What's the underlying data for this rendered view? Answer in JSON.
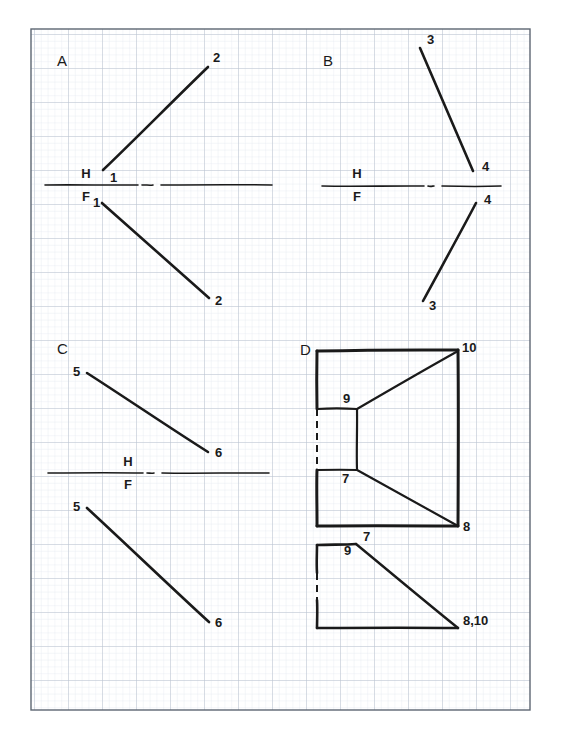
{
  "sheet": {
    "title": "Orthographic projection exercise sheet",
    "background_color": "#ffffff",
    "ink_color": "#1a1a1a",
    "grid": {
      "minor_color": "#dfe4ec",
      "major_color": "#b9c2cf",
      "border_color": "#6f7884",
      "minor_spacing": 6.8,
      "major_spacing": 34,
      "left": 31,
      "top": 29,
      "right": 530,
      "bottom": 710
    }
  },
  "chart_data": {
    "type": "diagram",
    "panels": [
      {
        "id": "A",
        "letter": "A",
        "letter_pos": [
          57,
          66
        ],
        "fold_line": {
          "label_top": "H",
          "label_bottom": "F",
          "label_x": 86,
          "label_top_y": 178,
          "label_bottom_y": 201,
          "y": 185,
          "x_start": 45,
          "x_end": 272,
          "gap_start": 138,
          "gap_end": 155
        },
        "lines": [
          {
            "name": "line-1-2-top",
            "x1": 103,
            "y1": 170,
            "x2": 208,
            "y2": 67,
            "width": 2.6
          },
          {
            "name": "line-1-2-bottom",
            "x1": 102,
            "y1": 203,
            "x2": 209,
            "y2": 298,
            "width": 2.6
          }
        ],
        "labels": [
          {
            "text": "1",
            "x": 110,
            "y": 182
          },
          {
            "text": "2",
            "x": 213,
            "y": 62
          },
          {
            "text": "1",
            "x": 93,
            "y": 207
          },
          {
            "text": "2",
            "x": 215,
            "y": 305
          }
        ]
      },
      {
        "id": "B",
        "letter": "B",
        "letter_pos": [
          323,
          66
        ],
        "fold_line": {
          "label_top": "H",
          "label_bottom": "F",
          "label_x": 357,
          "label_top_y": 178,
          "label_bottom_y": 201,
          "y": 186,
          "x_start": 322,
          "x_end": 501,
          "gap_start": 424,
          "gap_end": 436
        },
        "lines": [
          {
            "name": "line-3-4-top",
            "x1": 420,
            "y1": 48,
            "x2": 473,
            "y2": 171,
            "width": 2.6
          },
          {
            "name": "line-3-4-bottom",
            "x1": 423,
            "y1": 301,
            "x2": 476,
            "y2": 203,
            "width": 2.6
          }
        ],
        "labels": [
          {
            "text": "3",
            "x": 427,
            "y": 44
          },
          {
            "text": "4",
            "x": 482,
            "y": 171
          },
          {
            "text": "4",
            "x": 484,
            "y": 204
          },
          {
            "text": "3",
            "x": 429,
            "y": 310
          }
        ]
      },
      {
        "id": "C",
        "letter": "C",
        "letter_pos": [
          57,
          354
        ],
        "fold_line": {
          "label_top": "H",
          "label_bottom": "F",
          "label_x": 128,
          "label_top_y": 466,
          "label_bottom_y": 489,
          "y": 473,
          "x_start": 48,
          "x_end": 269,
          "gap_start": 143,
          "gap_end": 156
        },
        "lines": [
          {
            "name": "line-5-6-top",
            "x1": 87,
            "y1": 373,
            "x2": 208,
            "y2": 452,
            "width": 2.6
          },
          {
            "name": "line-5-6-bottom",
            "x1": 87,
            "y1": 508,
            "x2": 209,
            "y2": 622,
            "width": 2.6
          }
        ],
        "labels": [
          {
            "text": "5",
            "x": 73,
            "y": 376
          },
          {
            "text": "6",
            "x": 215,
            "y": 457
          },
          {
            "text": "5",
            "x": 73,
            "y": 511
          },
          {
            "text": "6",
            "x": 215,
            "y": 627
          }
        ]
      },
      {
        "id": "D",
        "letter": "D",
        "letter_pos": [
          300,
          355
        ],
        "fold_line": {
          "label_top": "",
          "label_bottom": "",
          "y": 0,
          "x_start": 0,
          "x_end": 0
        },
        "top_view": {
          "name": "d-top-view",
          "outline": [
            {
              "name": "d-top-edge",
              "x1": 317,
              "y1": 351,
              "x2": 458,
              "y2": 350,
              "width": 3.0
            },
            {
              "name": "d-left-upper-edge",
              "x1": 317,
              "y1": 351,
              "x2": 317,
              "y2": 409,
              "width": 3.0
            },
            {
              "name": "d-right-edge",
              "x1": 458,
              "y1": 350,
              "x2": 458,
              "y2": 526,
              "width": 3.0
            },
            {
              "name": "d-bottom-edge",
              "x1": 317,
              "y1": 526,
              "x2": 458,
              "y2": 526,
              "width": 3.0
            },
            {
              "name": "d-left-lower-edge",
              "x1": 317,
              "y1": 470,
              "x2": 317,
              "y2": 526,
              "width": 3.0
            },
            {
              "name": "d-notch-top",
              "x1": 317,
              "y1": 409,
              "x2": 357,
              "y2": 409,
              "width": 2.2
            },
            {
              "name": "d-notch-right",
              "x1": 357,
              "y1": 409,
              "x2": 357,
              "y2": 470,
              "width": 2.2
            },
            {
              "name": "d-notch-bottom",
              "x1": 317,
              "y1": 470,
              "x2": 357,
              "y2": 470,
              "width": 2.2
            },
            {
              "name": "d-diag-9-10",
              "x1": 357,
              "y1": 409,
              "x2": 458,
              "y2": 351,
              "width": 2.2
            },
            {
              "name": "d-diag-7-8",
              "x1": 357,
              "y1": 470,
              "x2": 458,
              "y2": 526,
              "width": 2.2
            }
          ],
          "hidden_left": {
            "name": "d-hidden-left-top",
            "x1": 317,
            "y1": 409,
            "x2": 317,
            "y2": 470,
            "width": 2.0
          },
          "labels": [
            {
              "text": "10",
              "x": 462,
              "y": 352
            },
            {
              "text": "9",
              "x": 343,
              "y": 403
            },
            {
              "text": "7",
              "x": 342,
              "y": 483
            },
            {
              "text": "8",
              "x": 463,
              "y": 531
            }
          ]
        },
        "front_view": {
          "name": "d-front-view",
          "outline": [
            {
              "name": "d-front-top-edge",
              "x1": 317,
              "y1": 545,
              "x2": 356,
              "y2": 544,
              "width": 2.6
            },
            {
              "name": "d-front-left-upper",
              "x1": 317,
              "y1": 545,
              "x2": 317,
              "y2": 573,
              "width": 2.6
            },
            {
              "name": "d-front-left-lower",
              "x1": 317,
              "y1": 600,
              "x2": 317,
              "y2": 628,
              "width": 2.6
            },
            {
              "name": "d-front-bottom-edge",
              "x1": 317,
              "y1": 628,
              "x2": 458,
              "y2": 628,
              "width": 2.6
            },
            {
              "name": "d-front-diag",
              "x1": 356,
              "y1": 544,
              "x2": 458,
              "y2": 628,
              "width": 2.4
            }
          ],
          "hidden_left": {
            "name": "d-hidden-left-front",
            "x1": 317,
            "y1": 573,
            "x2": 317,
            "y2": 600,
            "width": 2.0
          },
          "labels": [
            {
              "text": "7",
              "x": 363,
              "y": 541
            },
            {
              "text": "9",
              "x": 344,
              "y": 555
            },
            {
              "text": "8,10",
              "x": 463,
              "y": 625
            }
          ]
        }
      }
    ]
  }
}
